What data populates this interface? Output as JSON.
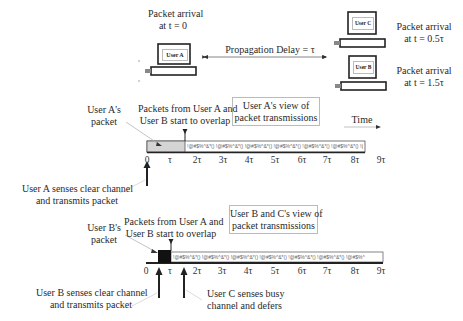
{
  "top": {
    "user_a": {
      "label": "User A",
      "arrival_line1": "Packet arrival",
      "arrival_line2": "at t = 0"
    },
    "user_c": {
      "label": "User C",
      "arrival_line1": "Packet arrival",
      "arrival_line2": "at t = 0.5τ"
    },
    "user_b": {
      "label": "User B",
      "arrival_line1": "Packet arrival",
      "arrival_line2": "at t = 1.5τ"
    },
    "propagation_label": "Propagation Delay = τ"
  },
  "timeline_a": {
    "view_line1": "User A's view of",
    "view_line2": "packet transmissions",
    "time_label": "Time",
    "packet_label_line1": "User A's",
    "packet_label_line2": "packet",
    "overlap_line1": "Packets from User A and",
    "overlap_line2": "User B start to overlap",
    "event_line1": "User A senses clear channel",
    "event_line2": "and transmits packet",
    "garbled": "!@#$%^&*() !@#$%^&*() !@#$%^&*() !@#$%^&*() !@#$%^&*() !@#$%^&*() !@#$%^&*() !@#",
    "ticks": [
      "0",
      "τ",
      "2τ",
      "3τ",
      "4τ",
      "5τ",
      "6τ",
      "7τ",
      "8τ",
      "9τ"
    ]
  },
  "timeline_b": {
    "view_line1": "User B and C's view of",
    "view_line2": "packet transmissions",
    "packet_label_line1": "User B's",
    "packet_label_line2": "packet",
    "overlap_line1": "Packets from User A and",
    "overlap_line2": "User B start to overlap",
    "event_b_line1": "User B senses clear channel",
    "event_b_line2": "and transmits packet",
    "event_c_line1": "User C senses busy",
    "event_c_line2": "channel and defers",
    "garbled": "!@#$%^&*() !@#$%^&*() !@#$%^&*() !@#$%^&*() !@#$%^&*() !@#$%^&*() !@#$%^",
    "ticks": [
      "0",
      "τ",
      "2τ",
      "3τ",
      "4τ",
      "5τ",
      "6τ",
      "7τ",
      "8τ",
      "9τ"
    ]
  },
  "colors": {
    "packet_a_fill": "#d4d4d4",
    "packet_b_fill": "#111111",
    "axis": "#222222"
  }
}
